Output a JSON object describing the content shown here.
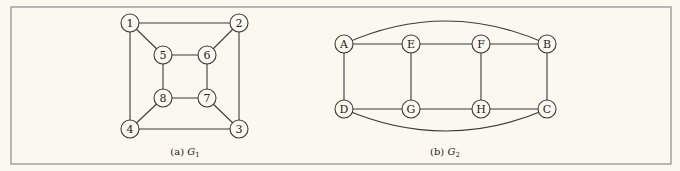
{
  "colors": {
    "background": "#fbf9ef",
    "stroke": "#3a3a3a",
    "frame": "#8a8a8a"
  },
  "graphs": [
    {
      "id": "G1",
      "caption": {
        "prefix": "(a) ",
        "name": "G",
        "subscript": "1"
      },
      "nodes": [
        {
          "id": "1",
          "label": "1",
          "x": 130,
          "y": 23
        },
        {
          "id": "2",
          "label": "2",
          "x": 239,
          "y": 23
        },
        {
          "id": "3",
          "label": "3",
          "x": 239,
          "y": 129
        },
        {
          "id": "4",
          "label": "4",
          "x": 130,
          "y": 129
        },
        {
          "id": "5",
          "label": "5",
          "x": 163,
          "y": 55
        },
        {
          "id": "6",
          "label": "6",
          "x": 207,
          "y": 55
        },
        {
          "id": "7",
          "label": "7",
          "x": 207,
          "y": 98
        },
        {
          "id": "8",
          "label": "8",
          "x": 163,
          "y": 98
        }
      ],
      "edges": [
        [
          "1",
          "2"
        ],
        [
          "2",
          "3"
        ],
        [
          "3",
          "4"
        ],
        [
          "4",
          "1"
        ],
        [
          "5",
          "6"
        ],
        [
          "6",
          "7"
        ],
        [
          "7",
          "8"
        ],
        [
          "8",
          "5"
        ],
        [
          "1",
          "5"
        ],
        [
          "2",
          "6"
        ],
        [
          "3",
          "7"
        ],
        [
          "4",
          "8"
        ]
      ]
    },
    {
      "id": "G2",
      "caption": {
        "prefix": "(b) ",
        "name": "G",
        "subscript": "2"
      },
      "nodes": [
        {
          "id": "A",
          "label": "A",
          "x": 344,
          "y": 44
        },
        {
          "id": "E",
          "label": "E",
          "x": 411,
          "y": 44
        },
        {
          "id": "F",
          "label": "F",
          "x": 481,
          "y": 44
        },
        {
          "id": "B",
          "label": "B",
          "x": 547,
          "y": 44
        },
        {
          "id": "D",
          "label": "D",
          "x": 344,
          "y": 109
        },
        {
          "id": "G",
          "label": "G",
          "x": 411,
          "y": 109
        },
        {
          "id": "H",
          "label": "H",
          "x": 481,
          "y": 109
        },
        {
          "id": "C",
          "label": "C",
          "x": 547,
          "y": 109
        }
      ],
      "edges": [
        [
          "A",
          "E"
        ],
        [
          "E",
          "F"
        ],
        [
          "F",
          "B"
        ],
        [
          "D",
          "G"
        ],
        [
          "G",
          "H"
        ],
        [
          "H",
          "C"
        ],
        [
          "A",
          "D"
        ],
        [
          "E",
          "G"
        ],
        [
          "F",
          "H"
        ],
        [
          "B",
          "C"
        ]
      ],
      "curved_edges": [
        {
          "from": "A",
          "to": "B",
          "bend": "up"
        },
        {
          "from": "D",
          "to": "C",
          "bend": "down"
        }
      ]
    }
  ]
}
